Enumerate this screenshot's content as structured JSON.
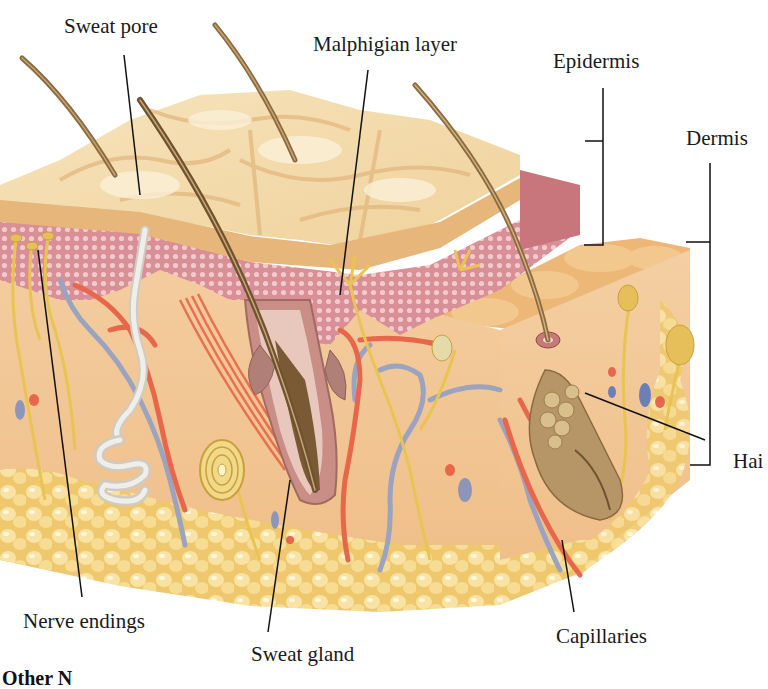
{
  "figure": {
    "colors": {
      "background": "#ffffff",
      "stratum_corneum": "#f3dcae",
      "stratum_corneum_shadow": "#e2b57c",
      "malphigian_layer": "#dca0a0",
      "malphigian_dots": "#f4d6d6",
      "dermis": "#f1c391",
      "fat": "#f6dd8c",
      "fat_highlight": "#fff5cf",
      "hair": "#8a6a3e",
      "artery": "#e8674a",
      "vein": "#9aa3bf",
      "nerve": "#e9c451",
      "sweat_gland": "#e4e2dc",
      "follicle": "#b88d7a",
      "leader_line": "#111111"
    }
  },
  "labels": {
    "sweat_pore": "Sweat pore",
    "malphigian_layer": "Malphigian layer",
    "epidermis": "Epidermis",
    "dermis": "Dermis",
    "hair_follicle": "Hai",
    "nerve_endings": "Nerve endings",
    "sweat_gland": "Sweat gland",
    "capillaries": "Capillaries"
  },
  "caption": {
    "partial_text": "Other N"
  }
}
